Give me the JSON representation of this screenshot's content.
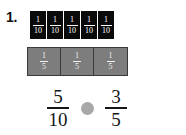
{
  "problem": {
    "number_label": "1.",
    "type": "fraction-comparison"
  },
  "strips": {
    "tenths": {
      "label": "tenths-strip",
      "tile_count": 5,
      "tile_numerator": "1",
      "tile_denominator": "10",
      "tile_color": "#0a0a0a",
      "text_color": "#ffffff",
      "tiles": [
        {
          "numerator": "1",
          "denominator": "10"
        },
        {
          "numerator": "1",
          "denominator": "10"
        },
        {
          "numerator": "1",
          "denominator": "10"
        },
        {
          "numerator": "1",
          "denominator": "10"
        },
        {
          "numerator": "1",
          "denominator": "10"
        }
      ]
    },
    "fifths": {
      "label": "fifths-strip",
      "tile_count": 3,
      "tile_numerator": "1",
      "tile_denominator": "5",
      "tile_color": "#7d7d7d",
      "text_color": "#efefef",
      "tiles": [
        {
          "numerator": "1",
          "denominator": "5"
        },
        {
          "numerator": "1",
          "denominator": "5"
        },
        {
          "numerator": "1",
          "denominator": "5"
        }
      ]
    }
  },
  "comparison": {
    "left_fraction": {
      "numerator": "5",
      "denominator": "10"
    },
    "operator_slot": {
      "name": "comparison-answer-slot",
      "value": "",
      "shape": "circle",
      "color": "#a8a8a8"
    },
    "right_fraction": {
      "numerator": "3",
      "denominator": "5"
    }
  },
  "colors": {
    "background": "#ffffff",
    "tenth_tile": "#0a0a0a",
    "fifth_tile": "#7d7d7d",
    "tile_border": "#3a3a3a",
    "text_dark": "#161616",
    "slot_gray": "#a8a8a8"
  }
}
